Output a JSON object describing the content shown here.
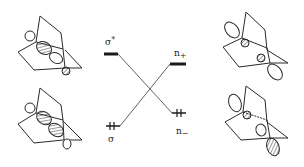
{
  "diagram": {
    "type": "molecular-orbital-correlation-diagram",
    "levels": {
      "sigma_star": {
        "label": "σ",
        "mark": "*",
        "occupancy": 0
      },
      "sigma": {
        "label": "σ",
        "occupancy": 2
      },
      "n_plus": {
        "label": "n",
        "mark": "+",
        "occupancy": 0
      },
      "n_minus": {
        "label": "n",
        "mark": "−",
        "occupancy": 2
      }
    },
    "orbital_drawings": [
      {
        "position": "top-left",
        "orbital": "σ*"
      },
      {
        "position": "bottom-left",
        "orbital": "σ"
      },
      {
        "position": "top-right",
        "orbital": "n+"
      },
      {
        "position": "bottom-right",
        "orbital": "n−"
      }
    ],
    "colors": {
      "ink": "#2a2a2a",
      "background": "#ffffff"
    }
  }
}
